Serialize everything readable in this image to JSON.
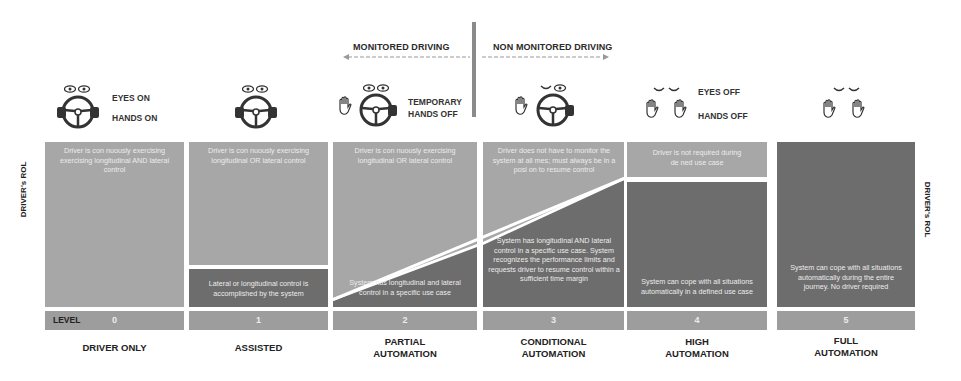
{
  "header": {
    "monitored": "MONITORED DRIVING",
    "non_monitored": "NON MONITORED DRIVING"
  },
  "icon_labels": {
    "eyes_on": "EYES ON",
    "hands_on": "HANDS ON",
    "temporary": "TEMPORARY",
    "hands_off_temp": "HANDS OFF",
    "eyes_off": "EYES OFF",
    "hands_off": "HANDS OFF"
  },
  "side_label": "DRIVER's ROL",
  "level_label": "LEVEL",
  "levels": [
    {
      "num": "0",
      "name_line1": "DRIVER ONLY",
      "name_line2": "",
      "driver_text": "Driver is con  nuously exercising exercising longitudinal AND lateral control",
      "system_text": ""
    },
    {
      "num": "1",
      "name_line1": "ASSISTED",
      "name_line2": "",
      "driver_text": "Driver is con  nuously exercising longitudinal OR lateral control",
      "system_text": "Lateral or longitudinal control is accomplished by the system"
    },
    {
      "num": "2",
      "name_line1": "PARTIAL",
      "name_line2": "AUTOMATION",
      "driver_text": "Driver is con  nuously exercising longitudinal OR lateral control",
      "system_text": "System has longitudinal and lateral control in a specific use case"
    },
    {
      "num": "3",
      "name_line1": "CONDITIONAL",
      "name_line2": "AUTOMATION",
      "driver_text": "Driver does not have to monitor the system at all    mes; must always be in a posi  on to resume control",
      "system_text": "System has longitudinal AND lateral control in a specific use case. System recognizes the performance limits and requests driver to resume control within a sufficient time margin"
    },
    {
      "num": "4",
      "name_line1": "HIGH",
      "name_line2": "AUTOMATION",
      "driver_text": "Driver is not required during de  ned use case",
      "system_text": "System can cope with all situations automatically in a defined use case"
    },
    {
      "num": "5",
      "name_line1": "FULL",
      "name_line2": "AUTOMATION",
      "driver_text": "",
      "system_text": "System can cope with all situations automatically during the entire journey. No driver required"
    }
  ],
  "colors": {
    "driver_zone": "#a7a7a7",
    "system_zone": "#6d6d6d",
    "level_bar": "#9d9d9d",
    "divider": "#8a8a8a"
  }
}
